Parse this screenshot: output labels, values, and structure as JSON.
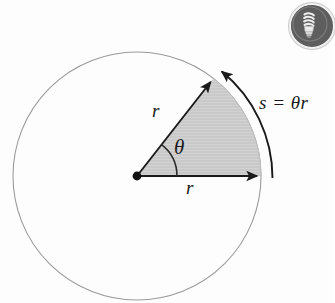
{
  "figure": {
    "type": "geometry-diagram",
    "background_color": "#fdfdfd",
    "circle": {
      "center_x": 137,
      "center_y": 176,
      "radius": 124,
      "stroke_color": "#9a9a9a",
      "stroke_width": 1.1,
      "fill": "none"
    },
    "sector": {
      "fill_color": "#c8c8c8",
      "stroke_color": "#2b2b2b",
      "start_angle_deg": 0,
      "end_angle_deg": 52,
      "radius": 124
    },
    "center_dot": {
      "radius": 4.2,
      "color": "#111111"
    },
    "angle_arc": {
      "radius": 40,
      "stroke_color": "#2b2b2b"
    },
    "arc_length_indicator": {
      "offset": 14,
      "stroke_color": "#1a1a1a",
      "arrow_at": "top"
    },
    "labels": {
      "radius_radial": "r",
      "radius_horizontal": "r",
      "angle": "θ",
      "arc_length": "s = θr"
    }
  },
  "badge": {
    "name": "cfl-lightbulb-badge",
    "background_color": "#5e5e5e",
    "ring_color": "#f2f2f2",
    "icon": "lightbulb-icon"
  }
}
